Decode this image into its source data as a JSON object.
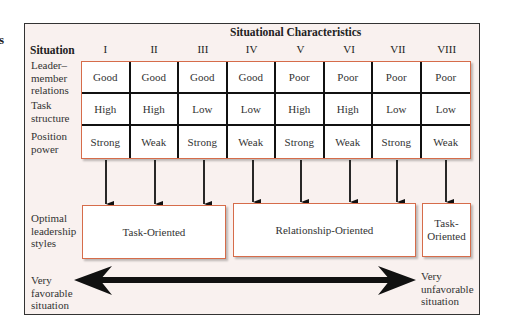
{
  "stray_text": "s",
  "diagram": {
    "title": "Situational Characteristics",
    "situation_label": "Situation",
    "situations": [
      "I",
      "II",
      "III",
      "IV",
      "V",
      "VI",
      "VII",
      "VIII"
    ],
    "rows": [
      {
        "label_lines": [
          "Leader–",
          "member",
          "relations"
        ],
        "values": [
          "Good",
          "Good",
          "Good",
          "Good",
          "Poor",
          "Poor",
          "Poor",
          "Poor"
        ]
      },
      {
        "label_lines": [
          "Task",
          "structure"
        ],
        "values": [
          "High",
          "High",
          "Low",
          "Low",
          "High",
          "High",
          "Low",
          "Low"
        ]
      },
      {
        "label_lines": [
          "Position",
          "power"
        ],
        "values": [
          "Strong",
          "Weak",
          "Strong",
          "Weak",
          "Strong",
          "Weak",
          "Strong",
          "Weak"
        ]
      }
    ],
    "styles_label_lines": [
      "Optimal",
      "leadership",
      "styles"
    ],
    "styles": [
      {
        "label": "Task-Oriented",
        "situations": [
          "I",
          "II",
          "III"
        ]
      },
      {
        "label": "Relationship-Oriented",
        "situations": [
          "IV",
          "V",
          "VI",
          "VII"
        ]
      },
      {
        "label_lines": [
          "Task-",
          "Oriented"
        ],
        "situations": [
          "VIII"
        ]
      }
    ],
    "continuum": {
      "left_lines": [
        "Very",
        "favorable",
        "situation"
      ],
      "right_lines": [
        "Very",
        "unfavorable",
        "situation"
      ]
    },
    "colors": {
      "accent_border": "#d66c4a",
      "frame_bg": "#f9f1ef",
      "grid_lines": "#111111"
    }
  }
}
